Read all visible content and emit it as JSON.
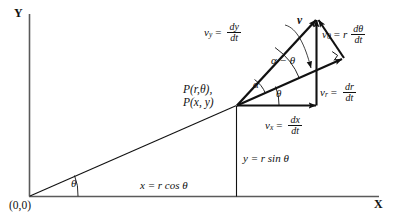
{
  "figure": {
    "axes": {
      "y_label": "Y",
      "x_label": "X",
      "origin_label": "(0,0)"
    },
    "point": {
      "polar_label": "P(r,θ),",
      "cartesian_label": "P(x, y)"
    },
    "angles": {
      "theta_origin": "θ",
      "theta_at_point": "θ",
      "alpha": "α",
      "alpha_minus_theta": "α − θ"
    },
    "projections": {
      "x_projection": "x = r cos θ",
      "y_projection": "y = r sin θ"
    },
    "vectors": {
      "resultant": "v",
      "v_y": {
        "name": "v",
        "sub": "y",
        "num": "dy",
        "den": "dt",
        "coef": ""
      },
      "v_x": {
        "name": "v",
        "sub": "x",
        "num": "dx",
        "den": "dt",
        "coef": ""
      },
      "v_r": {
        "name": "v",
        "sub": "r",
        "num": "dr",
        "den": "dt",
        "coef": ""
      },
      "v_theta": {
        "name": "v",
        "sub": "θ",
        "num": "dθ",
        "den": "dt",
        "coef": "r"
      }
    },
    "marks": {
      "right_angle": "right-angle-mark"
    },
    "colors": {
      "ink": "#111111",
      "axis": "#555555",
      "background": "#ffffff"
    }
  }
}
